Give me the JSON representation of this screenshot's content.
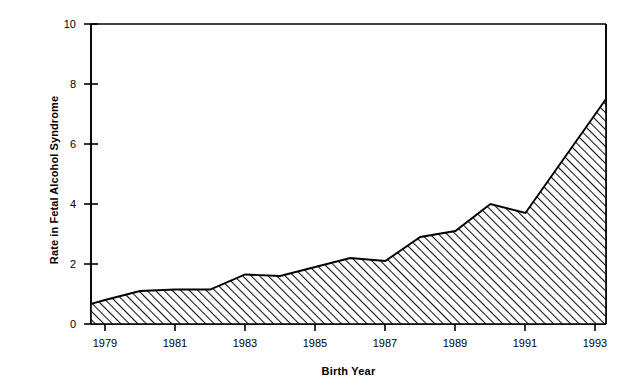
{
  "chart_data": {
    "type": "area",
    "title": "",
    "xlabel": "Birth Year",
    "ylabel": "Rate in Fetal Alcohol Syndrome",
    "xlim": [
      1978.6,
      1993.3
    ],
    "ylim": [
      0,
      10
    ],
    "xticks": [
      1979,
      1981,
      1983,
      1985,
      1987,
      1989,
      1991,
      1993
    ],
    "xtick_labels": [
      "1979",
      "1981",
      "1983",
      "1985",
      "1987",
      "1989",
      "1991",
      "1993"
    ],
    "yticks": [
      0,
      2,
      4,
      6,
      8,
      10
    ],
    "ytick_labels": [
      "0",
      "2",
      "4",
      "6",
      "8",
      "10"
    ],
    "grid": false,
    "legend": "none",
    "fill_pattern": "diagonal-hatch",
    "line_color": "#000000",
    "fill_color": "#ffffff",
    "x": [
      1978.6,
      1979,
      1980,
      1981,
      1982,
      1983,
      1984,
      1985,
      1986,
      1987,
      1988,
      1989,
      1990,
      1991,
      1993.3
    ],
    "values": [
      0.67,
      0.8,
      1.1,
      1.15,
      1.15,
      1.65,
      1.6,
      1.9,
      2.2,
      2.1,
      2.9,
      3.1,
      4.0,
      3.7,
      7.5
    ],
    "series": [
      {
        "name": "Rate in Fetal Alcohol Syndrome",
        "values": [
          0.67,
          0.8,
          1.1,
          1.15,
          1.15,
          1.65,
          1.6,
          1.9,
          2.2,
          2.1,
          2.9,
          3.1,
          4.0,
          3.7,
          7.5
        ]
      }
    ]
  },
  "axis": {
    "y_title": "Rate in Fetal Alcohol Syndrome",
    "x_title": "Birth Year",
    "y_ticks": [
      {
        "label": "10"
      },
      {
        "label": "8"
      },
      {
        "label": "6"
      },
      {
        "label": "4"
      },
      {
        "label": "2"
      },
      {
        "label": "0"
      }
    ],
    "x_ticks": [
      {
        "label": "1979"
      },
      {
        "label": "1981"
      },
      {
        "label": "1983"
      },
      {
        "label": "1985"
      },
      {
        "label": "1987"
      },
      {
        "label": "1989"
      },
      {
        "label": "1991"
      },
      {
        "label": "1993"
      }
    ]
  }
}
